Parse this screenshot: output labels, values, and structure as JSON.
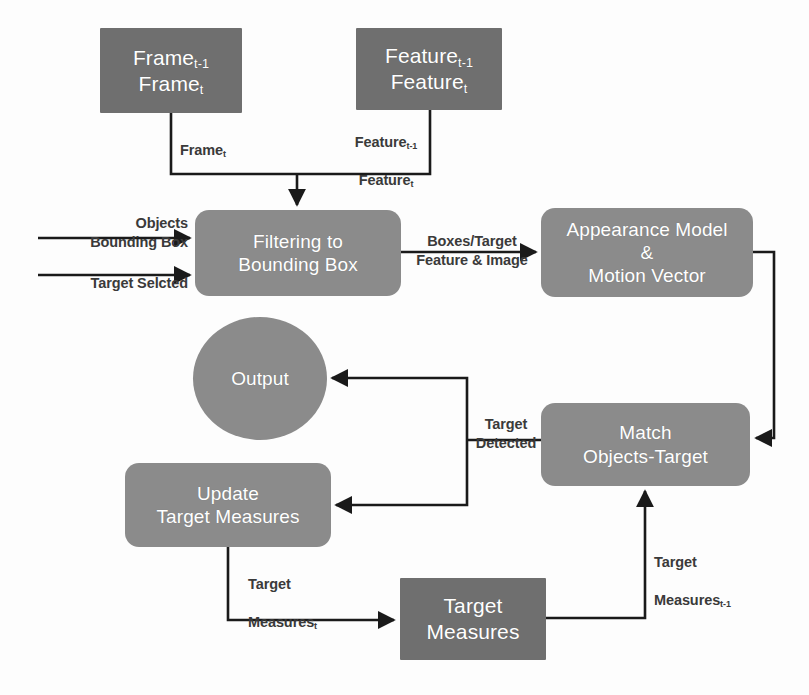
{
  "diagram": {
    "colors": {
      "sharp_box": "#6f6f6f",
      "round_box": "#8b8b8b",
      "circle": "#8b8b8b",
      "node_text": "#ffffff",
      "edge": "#1a1a1a",
      "edge_label": "#3a3a3a",
      "background": "#fdfdfd"
    },
    "nodes": [
      {
        "id": "frames",
        "shape": "rectangle",
        "line1": "Frame",
        "sub1": "t-1",
        "line2": "Frame",
        "sub2": "t"
      },
      {
        "id": "features",
        "shape": "rectangle",
        "line1": "Feature",
        "sub1": "t-1",
        "line2": "Feature",
        "sub2": "t"
      },
      {
        "id": "filtering",
        "shape": "rounded",
        "line1": "Filtering to",
        "line2": "Bounding Box"
      },
      {
        "id": "appearance",
        "shape": "rounded",
        "line1": "Appearance Model",
        "line2": "&",
        "line3": "Motion Vector"
      },
      {
        "id": "output",
        "shape": "circle",
        "line1": "Output"
      },
      {
        "id": "match",
        "shape": "rounded",
        "line1": "Match",
        "line2": "Objects-Target"
      },
      {
        "id": "update",
        "shape": "rounded",
        "line1": "Update",
        "line2": "Target Measures"
      },
      {
        "id": "measures",
        "shape": "rectangle",
        "line1": "Target",
        "line2": "Measures"
      }
    ],
    "edge_labels": {
      "frame_t": "Frame",
      "frame_t_sub": "t",
      "feature_line1": "Feature",
      "feature_sub1": "t-1",
      "feature_line2": "Feature",
      "feature_sub2": "t",
      "objects_bounding_box": "Objects\nBounding  Box",
      "target_selected": "Target Selcted",
      "boxes_target": "Boxes/Target\nFeature & Image",
      "target_detected": "Target\nDetected",
      "target_measures_prev_line1": "Target",
      "target_measures_prev_line2": "Measures",
      "target_measures_prev_sub": "t-1",
      "target_measures_t_line1": "Target",
      "target_measures_t_line2": "Measures",
      "target_measures_t_sub": "t"
    }
  }
}
